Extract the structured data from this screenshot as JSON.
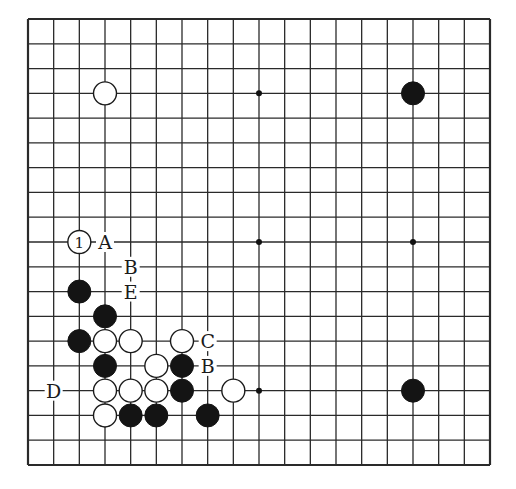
{
  "board": {
    "size": 19,
    "origin_x": 28,
    "origin_y": 19,
    "end_x": 490,
    "end_y": 465,
    "line_color": "#2a2a2a",
    "background": "#ffffff",
    "hoshi": [
      [
        3,
        3
      ],
      [
        9,
        3
      ],
      [
        15,
        3
      ],
      [
        3,
        9
      ],
      [
        9,
        9
      ],
      [
        15,
        9
      ],
      [
        3,
        15
      ],
      [
        9,
        15
      ],
      [
        15,
        15
      ]
    ]
  },
  "stones": [
    {
      "color": "white",
      "col": 3,
      "row": 3
    },
    {
      "color": "black",
      "col": 15,
      "row": 3
    },
    {
      "color": "black",
      "col": 15,
      "row": 15
    },
    {
      "color": "white",
      "col": 2,
      "row": 9,
      "number": "1"
    },
    {
      "color": "black",
      "col": 2,
      "row": 11
    },
    {
      "color": "black",
      "col": 3,
      "row": 12
    },
    {
      "color": "black",
      "col": 2,
      "row": 13
    },
    {
      "color": "white",
      "col": 3,
      "row": 13
    },
    {
      "color": "white",
      "col": 4,
      "row": 13
    },
    {
      "color": "white",
      "col": 6,
      "row": 13
    },
    {
      "color": "black",
      "col": 3,
      "row": 14
    },
    {
      "color": "white",
      "col": 5,
      "row": 14
    },
    {
      "color": "black",
      "col": 6,
      "row": 14
    },
    {
      "color": "white",
      "col": 3,
      "row": 15
    },
    {
      "color": "white",
      "col": 4,
      "row": 15
    },
    {
      "color": "white",
      "col": 5,
      "row": 15
    },
    {
      "color": "black",
      "col": 6,
      "row": 15
    },
    {
      "color": "white",
      "col": 8,
      "row": 15
    },
    {
      "color": "white",
      "col": 3,
      "row": 16
    },
    {
      "color": "black",
      "col": 4,
      "row": 16
    },
    {
      "color": "black",
      "col": 5,
      "row": 16
    },
    {
      "color": "black",
      "col": 7,
      "row": 16
    }
  ],
  "labels": [
    {
      "text": "A",
      "col": 3,
      "row": 9
    },
    {
      "text": "B",
      "col": 4,
      "row": 10
    },
    {
      "text": "E",
      "col": 4,
      "row": 11
    },
    {
      "text": "C",
      "col": 7,
      "row": 13
    },
    {
      "text": "B",
      "col": 7,
      "row": 14
    },
    {
      "text": "D",
      "col": 1,
      "row": 15
    }
  ]
}
